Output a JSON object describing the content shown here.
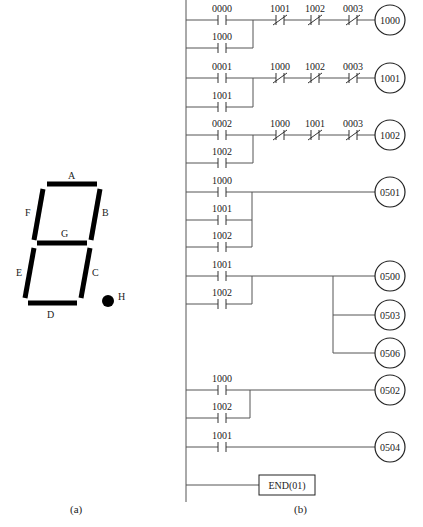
{
  "figure_a": {
    "caption": "(a)",
    "segments": [
      {
        "id": "A",
        "label": "A"
      },
      {
        "id": "B",
        "label": "B"
      },
      {
        "id": "C",
        "label": "C"
      },
      {
        "id": "D",
        "label": "D"
      },
      {
        "id": "E",
        "label": "E"
      },
      {
        "id": "F",
        "label": "F"
      },
      {
        "id": "G",
        "label": "G"
      },
      {
        "id": "H",
        "label": "H"
      }
    ]
  },
  "figure_b": {
    "caption": "(b)",
    "rungs": [
      {
        "main_contact": {
          "type": "NO",
          "address": "0000"
        },
        "branch_contacts": [
          {
            "type": "NO",
            "address": "1000"
          }
        ],
        "series_contacts": [
          {
            "type": "NC",
            "address": "1001"
          },
          {
            "type": "NC",
            "address": "1002"
          },
          {
            "type": "NC",
            "address": "0003"
          }
        ],
        "coils": [
          "1000"
        ]
      },
      {
        "main_contact": {
          "type": "NO",
          "address": "0001"
        },
        "branch_contacts": [
          {
            "type": "NO",
            "address": "1001"
          }
        ],
        "series_contacts": [
          {
            "type": "NC",
            "address": "1000"
          },
          {
            "type": "NC",
            "address": "1002"
          },
          {
            "type": "NC",
            "address": "0003"
          }
        ],
        "coils": [
          "1001"
        ]
      },
      {
        "main_contact": {
          "type": "NO",
          "address": "0002"
        },
        "branch_contacts": [
          {
            "type": "NO",
            "address": "1002"
          }
        ],
        "series_contacts": [
          {
            "type": "NC",
            "address": "1000"
          },
          {
            "type": "NC",
            "address": "1001"
          },
          {
            "type": "NC",
            "address": "0003"
          }
        ],
        "coils": [
          "1002"
        ]
      },
      {
        "main_contact": {
          "type": "NO",
          "address": "1000"
        },
        "branch_contacts": [
          {
            "type": "NO",
            "address": "1001"
          },
          {
            "type": "NO",
            "address": "1002"
          }
        ],
        "series_contacts": [],
        "coils": [
          "0501"
        ]
      },
      {
        "main_contact": {
          "type": "NO",
          "address": "1001"
        },
        "branch_contacts": [
          {
            "type": "NO",
            "address": "1002"
          }
        ],
        "series_contacts": [],
        "coils": [
          "0500",
          "0503",
          "0506"
        ]
      },
      {
        "main_contact": {
          "type": "NO",
          "address": "1000"
        },
        "branch_contacts": [
          {
            "type": "NO",
            "address": "1002"
          }
        ],
        "series_contacts": [],
        "coils": [
          "0502"
        ]
      },
      {
        "main_contact": {
          "type": "NO",
          "address": "1001"
        },
        "branch_contacts": [],
        "series_contacts": [],
        "coils": [
          "0504"
        ]
      }
    ],
    "end_instruction": "END(01)"
  }
}
